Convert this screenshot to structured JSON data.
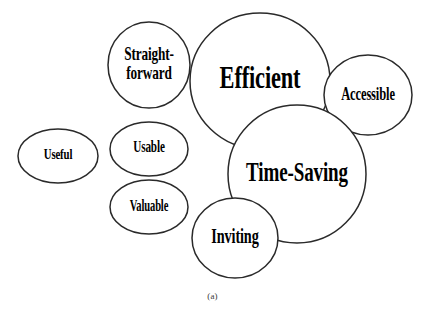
{
  "figure": {
    "caption": "(a)",
    "background_color": "#ffffff",
    "stroke_color": "#2a2a2a",
    "text_color": "#000000",
    "bubbles": [
      {
        "id": "useful",
        "label": "Useful",
        "cx": 58,
        "cy": 156,
        "rx": 40,
        "ry": 27,
        "font_size": 15,
        "scale_x": 0.72,
        "lines": [
          "Useful"
        ]
      },
      {
        "id": "straightforward",
        "label": "Straight-forward",
        "cx": 149,
        "cy": 65,
        "rx": 41,
        "ry": 43,
        "font_size": 19,
        "scale_x": 0.7,
        "lines": [
          "Straight-",
          "forward"
        ]
      },
      {
        "id": "efficient",
        "label": "Efficient",
        "cx": 260,
        "cy": 81,
        "rx": 70,
        "ry": 68,
        "font_size": 32,
        "scale_x": 0.7,
        "lines": [
          "Efficient"
        ]
      },
      {
        "id": "accessible",
        "label": "Accessible",
        "cx": 368,
        "cy": 95,
        "rx": 44,
        "ry": 40,
        "font_size": 19,
        "scale_x": 0.66,
        "lines": [
          "Accessible"
        ]
      },
      {
        "id": "usable",
        "label": "Usable",
        "cx": 149,
        "cy": 149,
        "rx": 39,
        "ry": 27,
        "font_size": 16,
        "scale_x": 0.7,
        "lines": [
          "Usable"
        ]
      },
      {
        "id": "valuable",
        "label": "Valuable",
        "cx": 149,
        "cy": 207,
        "rx": 39,
        "ry": 27,
        "font_size": 16,
        "scale_x": 0.66,
        "lines": [
          "Valuable"
        ]
      },
      {
        "id": "time-saving",
        "label": "Time-Saving",
        "cx": 297,
        "cy": 174,
        "rx": 69,
        "ry": 69,
        "font_size": 28,
        "scale_x": 0.68,
        "lines": [
          "Time-Saving"
        ]
      },
      {
        "id": "inviting",
        "label": "Inviting",
        "cx": 235,
        "cy": 238,
        "rx": 43,
        "ry": 40,
        "font_size": 21,
        "scale_x": 0.68,
        "lines": [
          "Inviting"
        ]
      }
    ]
  }
}
